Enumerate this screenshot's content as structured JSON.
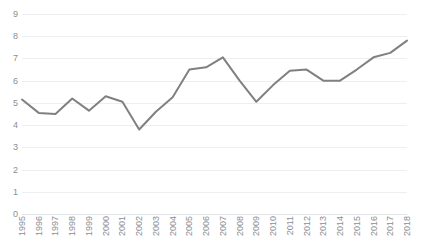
{
  "chart_data": {
    "type": "line",
    "title": "",
    "subtitle": "",
    "xlabel": "",
    "ylabel": "",
    "grid": true,
    "legend": false,
    "legend_position": "none",
    "line_color": "#808080",
    "gridline_color": "#ECEFF1",
    "tick_label_color": "#8B8E93",
    "xlim_categories": [
      "1995",
      "2018"
    ],
    "ylim": [
      0,
      9
    ],
    "yticks": [
      0,
      1,
      2,
      3,
      4,
      5,
      6,
      7,
      8,
      9
    ],
    "ytick_labels": [
      "0",
      "1",
      "2",
      "3",
      "4",
      "5",
      "6",
      "7",
      "8",
      "9"
    ],
    "categories": [
      "1995",
      "1996",
      "1997",
      "1998",
      "1999",
      "2000",
      "2001",
      "2002",
      "2003",
      "2004",
      "2005",
      "2006",
      "2007",
      "2008",
      "2009",
      "2010",
      "2011",
      "2012",
      "2013",
      "2014",
      "2015",
      "2016",
      "2017",
      "2018"
    ],
    "values": [
      5.15,
      4.55,
      4.5,
      5.2,
      4.65,
      5.3,
      5.05,
      3.8,
      4.6,
      5.25,
      6.5,
      6.6,
      7.05,
      6.0,
      5.05,
      5.8,
      6.45,
      6.5,
      6.0,
      6.0,
      6.5,
      7.05,
      7.25,
      7.8
    ],
    "series": [
      {
        "name": "Series 1",
        "values": [
          5.15,
          4.55,
          4.5,
          5.2,
          4.65,
          5.3,
          5.05,
          3.8,
          4.6,
          5.25,
          6.5,
          6.6,
          7.05,
          6.0,
          5.05,
          5.8,
          6.45,
          6.5,
          6.0,
          6.0,
          6.5,
          7.05,
          7.25,
          7.8
        ],
        "color": "#808080",
        "marker": "none",
        "line_width": 2
      }
    ],
    "annotations": []
  }
}
